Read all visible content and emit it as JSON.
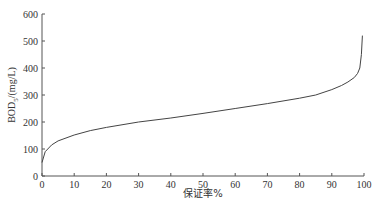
{
  "chart_data": {
    "type": "line",
    "title": "",
    "xlabel": "保证率%",
    "ylabel": "BOD5/(mg/L)",
    "ylabel_main": "BOD",
    "ylabel_sub": "5",
    "ylabel_unit": "/(mg/L)",
    "xlim": [
      0,
      100
    ],
    "ylim": [
      0,
      600
    ],
    "x_ticks": [
      0,
      10,
      20,
      30,
      40,
      50,
      60,
      70,
      80,
      90,
      100
    ],
    "y_ticks": [
      0,
      100,
      200,
      300,
      400,
      500,
      600
    ],
    "grid": false,
    "legend": null,
    "series": [
      {
        "name": "BOD5",
        "x": [
          0,
          1,
          3,
          5,
          10,
          15,
          20,
          30,
          40,
          50,
          60,
          70,
          80,
          85,
          90,
          93,
          95,
          97,
          98,
          98.7,
          99.2,
          99.5
        ],
        "values": [
          50,
          90,
          115,
          130,
          152,
          168,
          180,
          200,
          215,
          232,
          250,
          268,
          288,
          300,
          320,
          335,
          348,
          365,
          380,
          400,
          450,
          520
        ]
      }
    ]
  },
  "colors": {
    "line": "#444444",
    "axis": "#555555"
  }
}
